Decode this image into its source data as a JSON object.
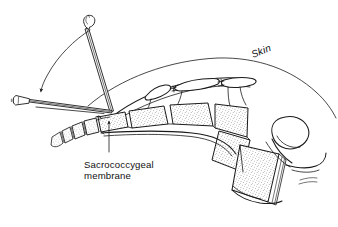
{
  "figure": {
    "background_color": "#ffffff",
    "ink_color": "#1a1a1a",
    "width": 338,
    "height": 227
  },
  "labels": {
    "skin": "Skin",
    "membrane_line1": "Sacrococcygeal",
    "membrane_line2": "membrane"
  },
  "annotations": {
    "skin_label_rotation_deg": -22,
    "leader_arrow_target": "sacrococcygeal-membrane",
    "rotation_arrow_meaning": "needle redirected from steep angle to shallow angle"
  },
  "anatomy": {
    "coccygeal_segments": 4,
    "sacral_segments": 4,
    "lumbar_body": 1,
    "skin_curve": "posterior skin surface arc"
  },
  "instrument": {
    "needle_positions": 2,
    "initial_angle_label": "steep",
    "final_angle_label": "shallow"
  }
}
